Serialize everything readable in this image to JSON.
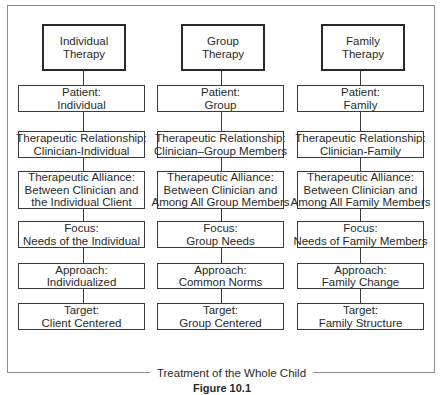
{
  "diagram": {
    "type": "comparison-flowchart",
    "columns": [
      {
        "id": "individual",
        "header": [
          "Individual",
          "Therapy"
        ],
        "rows": [
          [
            "Patient:",
            "Individual"
          ],
          [
            "Therapeutic Relationship:",
            "Clinician-Individual"
          ],
          [
            "Therapeutic Alliance:",
            "Between Clinician and",
            "the Individual Client"
          ],
          [
            "Focus:",
            "Needs of the Individual"
          ],
          [
            "Approach:",
            "Individualized"
          ],
          [
            "Target:",
            "Client Centered"
          ]
        ]
      },
      {
        "id": "group",
        "header": [
          "Group",
          "Therapy"
        ],
        "rows": [
          [
            "Patient:",
            "Group"
          ],
          [
            "Therapeutic Relationship:",
            "Clinician–Group Members"
          ],
          [
            "Therapeutic Alliance:",
            "Between Clinician and",
            "Among All Group Members"
          ],
          [
            "Focus:",
            "Group Needs"
          ],
          [
            "Approach:",
            "Common Norms"
          ],
          [
            "Target:",
            "Group Centered"
          ]
        ]
      },
      {
        "id": "family",
        "header": [
          "Family",
          "Therapy"
        ],
        "rows": [
          [
            "Patient:",
            "Family"
          ],
          [
            "Therapeutic Relationship:",
            "Clinician-Family"
          ],
          [
            "Therapeutic Alliance:",
            "Between Clinician and",
            "Among All Family Members"
          ],
          [
            "Focus:",
            "Needs of Family Members"
          ],
          [
            "Approach:",
            "Family Change"
          ],
          [
            "Target:",
            "Family Structure"
          ]
        ]
      }
    ],
    "frame_label": "Treatment of the Whole Child",
    "caption": "Figure 10.1"
  }
}
